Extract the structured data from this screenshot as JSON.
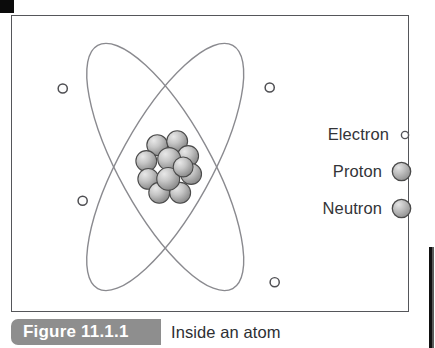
{
  "figure": {
    "caption_number": "Figure 11.1.1",
    "caption_text": "Inside an atom",
    "frame_border_color": "#55565a",
    "background_color": "#ffffff",
    "caption_tab_color": "#8e8e8e"
  },
  "diagram": {
    "type": "atom-model",
    "title": "Inside an atom",
    "orbit_color": "#8a8a8f",
    "center": {
      "x": 165,
      "y": 165
    },
    "orbits": [
      {
        "name": "orbit-1",
        "rx": 46,
        "ry": 140,
        "rotation_deg": 28
      },
      {
        "name": "orbit-2",
        "rx": 46,
        "ry": 140,
        "rotation_deg": -28
      }
    ],
    "electrons": [
      {
        "name": "electron-top-left",
        "x": 62,
        "y": 88,
        "r": 4.5
      },
      {
        "name": "electron-top-right",
        "x": 270,
        "y": 87,
        "r": 4.5
      },
      {
        "name": "electron-mid-left",
        "x": 82,
        "y": 201,
        "r": 4.5
      },
      {
        "name": "electron-bottom-right",
        "x": 275,
        "y": 283,
        "r": 4.5
      }
    ],
    "nucleus": {
      "name": "nucleus",
      "center": {
        "x": 165,
        "y": 157
      },
      "diameter": 44,
      "particle_count": 11,
      "particle_fill_light": "#d7d7d7",
      "particle_fill_dark": "#8d8d8d",
      "particle_stroke": "#4a4a4a"
    }
  },
  "legend": {
    "items": [
      {
        "label": "Electron",
        "symbol": "electron-symbol",
        "size": 8,
        "style": "outline"
      },
      {
        "label": "Proton",
        "symbol": "proton-symbol",
        "size": 19,
        "style": "sphere"
      },
      {
        "label": "Neutron",
        "symbol": "neutron-symbol",
        "size": 19,
        "style": "sphere"
      }
    ]
  }
}
